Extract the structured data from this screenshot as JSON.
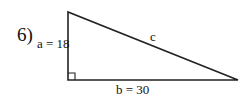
{
  "problem": {
    "number_label": "6)",
    "side_a_label": "a = 18",
    "side_b_label": "b = 30",
    "hypotenuse_label": "c"
  },
  "figure": {
    "type": "right-triangle",
    "right_angle_vertex": "bottom-left",
    "side_a": 18,
    "side_b": 30,
    "hypotenuse": "c",
    "stroke_color": "#222222"
  }
}
